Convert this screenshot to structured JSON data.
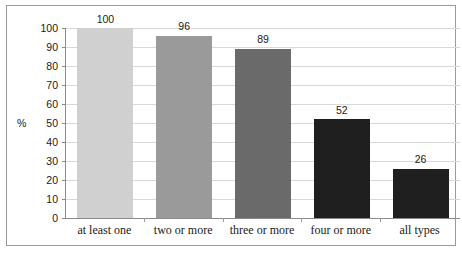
{
  "chart_data": {
    "type": "bar",
    "title": "",
    "subtitle": "",
    "xlabel": "",
    "ylabel": "%",
    "categories": [
      "at least one",
      "two or more",
      "three or more",
      "four or more",
      "all types"
    ],
    "values": [
      100,
      96,
      89,
      52,
      26
    ],
    "value_labels": [
      "100",
      "96",
      "89",
      "52",
      "26"
    ],
    "bar_colors": [
      "#d0d0d0",
      "#9a9a9a",
      "#6a6a6a",
      "#1f1f1f",
      "#1f1f1f"
    ],
    "ylim": [
      0,
      100
    ],
    "ytick_values": [
      0,
      10,
      20,
      30,
      40,
      50,
      60,
      70,
      80,
      90,
      100
    ],
    "ytick_labels": [
      "0",
      "10",
      "20",
      "30",
      "40",
      "50",
      "60",
      "70",
      "80",
      "90",
      "100"
    ],
    "grid": true,
    "grid_color": "#d8d8d8",
    "axis_color": "#8a8a8a",
    "frame_color": "#9a9a9a",
    "background_color": "#ffffff",
    "legend": null,
    "legend_position": "none",
    "series": [
      {
        "name": "percent",
        "values": [
          100,
          96,
          89,
          52,
          26
        ]
      }
    ]
  }
}
